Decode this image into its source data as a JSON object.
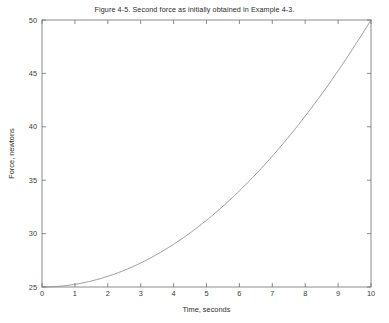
{
  "figure": {
    "title": "Figure 4-5. Second force as initially obtained in Example 4-3.",
    "background_color": "#ffffff",
    "axis_color": "#6f6f6f",
    "curve_color": "#8a8a8a",
    "text_color": "#2b2b2b"
  },
  "chart_data": {
    "type": "line",
    "title": "Figure 4-5. Second force as initially obtained in Example 4-3.",
    "xlabel": "Time, seconds",
    "ylabel": "Force, newtons",
    "xlim": [
      0,
      10
    ],
    "ylim": [
      25,
      50
    ],
    "xticks": [
      0,
      1,
      2,
      3,
      4,
      5,
      6,
      7,
      8,
      9,
      10
    ],
    "xtick_labels": [
      "0",
      "1",
      "2",
      "3",
      "4",
      "5",
      "6",
      "7",
      "8",
      "9",
      "10"
    ],
    "yticks": [
      25,
      30,
      35,
      40,
      45,
      50
    ],
    "ytick_labels": [
      "25",
      "30",
      "35",
      "40",
      "45",
      "50"
    ],
    "grid": false,
    "legend": null,
    "tick_direction": "in",
    "box": true,
    "relation": "F = 25 + 0.25 * t^2",
    "series": [
      {
        "name": "Second force",
        "x": [
          0,
          0.5,
          1,
          1.5,
          2,
          2.5,
          3,
          3.5,
          4,
          4.5,
          5,
          5.5,
          6,
          6.5,
          7,
          7.5,
          8,
          8.5,
          9,
          9.5,
          10
        ],
        "values": [
          25,
          25.06,
          25.25,
          25.56,
          26,
          26.56,
          27.25,
          28.06,
          29,
          30.06,
          31.25,
          32.56,
          34,
          35.56,
          37.25,
          39.06,
          41,
          43.06,
          45.25,
          47.56,
          50
        ]
      }
    ]
  }
}
